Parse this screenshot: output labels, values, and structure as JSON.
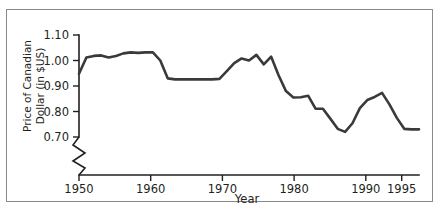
{
  "chart_data": {
    "type": "line",
    "title": "",
    "xlabel": "Year",
    "ylabel_line1": "Price of Canadian",
    "ylabel_line2": "Dollar (in $US)",
    "ylabel": "Price of Canadian Dollar (in $US)",
    "xlim": [
      1950,
      1996
    ],
    "ylim": [
      0.7,
      1.1
    ],
    "yticks": [
      1.1,
      1.0,
      0.9,
      0.8,
      0.7
    ],
    "ytick_labels": [
      "1.10",
      "1.00",
      "0.90",
      "0.80",
      "0.70"
    ],
    "xticks": [
      1950,
      1960,
      1970,
      1980,
      1990,
      1995
    ],
    "xtick_labels": [
      "1950",
      "1960",
      "1970",
      "1980",
      "1990",
      "1995"
    ],
    "grid": false,
    "legend": "none",
    "axis_break": "y-axis broken below 0.70",
    "line_color": "#3a3a3a",
    "frame_color": "#8a8a8a",
    "series": [
      {
        "name": "Price of Canadian Dollar (in $US)",
        "x": [
          1950,
          1951,
          1952,
          1953,
          1954,
          1955,
          1956,
          1957,
          1958,
          1959,
          1960,
          1961,
          1962,
          1963,
          1964,
          1965,
          1966,
          1967,
          1968,
          1969,
          1970,
          1971,
          1972,
          1973,
          1974,
          1975,
          1976,
          1977,
          1978,
          1979,
          1980,
          1981,
          1982,
          1983,
          1984,
          1985,
          1986,
          1987,
          1988,
          1989,
          1990,
          1991,
          1992,
          1993,
          1994,
          1995,
          1996
        ],
        "values": [
          0.948,
          1.012,
          1.018,
          1.02,
          1.012,
          1.018,
          1.028,
          1.032,
          1.03,
          1.032,
          1.032,
          1.0,
          0.93,
          0.926,
          0.926,
          0.926,
          0.926,
          0.926,
          0.926,
          0.928,
          0.958,
          0.99,
          1.008,
          1.0,
          1.022,
          0.985,
          1.015,
          0.942,
          0.88,
          0.855,
          0.856,
          0.862,
          0.811,
          0.811,
          0.772,
          0.732,
          0.72,
          0.754,
          0.813,
          0.845,
          0.857,
          0.873,
          0.828,
          0.775,
          0.732,
          0.73,
          0.73
        ]
      }
    ]
  }
}
